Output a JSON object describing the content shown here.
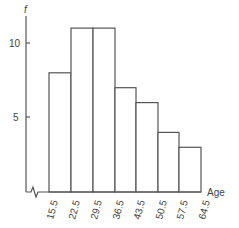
{
  "chart_data": {
    "type": "bar",
    "subtype": "histogram",
    "title": "",
    "xlabel": "Age",
    "ylabel": "f",
    "bin_edges": [
      15.5,
      22.5,
      29.5,
      36.5,
      43.5,
      50.5,
      57.5,
      64.5
    ],
    "categories": [
      "15.5-22.5",
      "22.5-29.5",
      "29.5-36.5",
      "36.5-43.5",
      "43.5-50.5",
      "50.5-57.5",
      "57.5-64.5"
    ],
    "values": [
      8,
      11,
      11,
      7,
      6,
      4,
      3
    ],
    "x_tick_labels": [
      "15.5",
      "22.5",
      "29.5",
      "36.5",
      "43.5",
      "50.5",
      "57.5",
      "64.5"
    ],
    "y_tick_labels": [
      "5",
      "10"
    ],
    "y_ticks": [
      5,
      10
    ],
    "ylim": [
      0,
      12
    ],
    "axis_break": true,
    "grid": false,
    "legend": null
  },
  "labels": {
    "y_axis": "f",
    "x_axis": "Age",
    "y_ticks": [
      "5",
      "10"
    ],
    "x_ticks": [
      "15.5",
      "22.5",
      "29.5",
      "36.5",
      "43.5",
      "50.5",
      "57.5",
      "64.5"
    ]
  }
}
